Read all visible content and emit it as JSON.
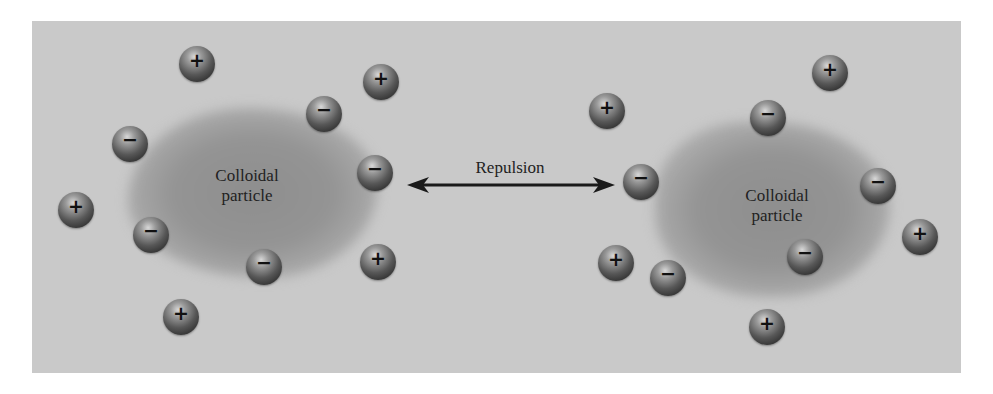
{
  "figure": {
    "background_color": "#c9c9c9",
    "ion_color": "#4a4a4a",
    "particles": [
      {
        "label_line1": "Colloidal",
        "label_line2": "particle",
        "side": "left"
      },
      {
        "label_line1": "Colloidal",
        "label_line2": "particle",
        "side": "right"
      }
    ],
    "repulsion_label": "Repulsion",
    "arrow": "double-headed arrow between particles",
    "ions": {
      "left": [
        {
          "charge": "+",
          "x": 197,
          "y": 64
        },
        {
          "charge": "+",
          "x": 381,
          "y": 82
        },
        {
          "charge": "−",
          "x": 324,
          "y": 114
        },
        {
          "charge": "−",
          "x": 130,
          "y": 144
        },
        {
          "charge": "−",
          "x": 375,
          "y": 173
        },
        {
          "charge": "+",
          "x": 76,
          "y": 210
        },
        {
          "charge": "−",
          "x": 151,
          "y": 235
        },
        {
          "charge": "−",
          "x": 264,
          "y": 267
        },
        {
          "charge": "+",
          "x": 378,
          "y": 262
        },
        {
          "charge": "+",
          "x": 181,
          "y": 317
        }
      ],
      "right": [
        {
          "charge": "+",
          "x": 607,
          "y": 111
        },
        {
          "charge": "+",
          "x": 830,
          "y": 73
        },
        {
          "charge": "−",
          "x": 768,
          "y": 118
        },
        {
          "charge": "−",
          "x": 641,
          "y": 182
        },
        {
          "charge": "−",
          "x": 878,
          "y": 186
        },
        {
          "charge": "+",
          "x": 920,
          "y": 237
        },
        {
          "charge": "+",
          "x": 616,
          "y": 263
        },
        {
          "charge": "−",
          "x": 668,
          "y": 278
        },
        {
          "charge": "−",
          "x": 805,
          "y": 257
        },
        {
          "charge": "+",
          "x": 767,
          "y": 327
        }
      ]
    }
  }
}
